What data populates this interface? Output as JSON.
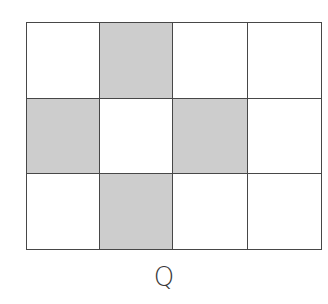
{
  "figure": {
    "label": "Q",
    "rows": 3,
    "cols": 4,
    "col_edges": [
      0,
      73,
      146,
      221,
      295
    ],
    "row_edges": [
      0,
      76,
      151,
      227
    ],
    "shaded_cells": [
      [
        0,
        1
      ],
      [
        1,
        0
      ],
      [
        1,
        2
      ],
      [
        2,
        1
      ]
    ],
    "colors": {
      "shaded": "#cdcdcd",
      "empty": "#ffffff",
      "line": "#474747"
    }
  }
}
